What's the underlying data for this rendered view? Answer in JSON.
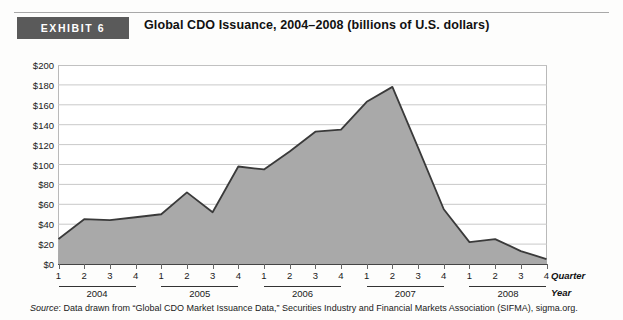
{
  "exhibit": {
    "badge_label": "EXHIBIT 6",
    "title": "Global CDO Issuance, 2004–2008 (billions of U.S. dollars)"
  },
  "source": {
    "prefix": "Source",
    "text": ": Data drawn from “Global CDO Market Issuance Data,” Securities Industry and Financial Markets Association (SIFMA), sigma.org."
  },
  "axis_captions": {
    "quarter": "Quarter",
    "year": "Year"
  },
  "colors": {
    "badge_bg": "#5a5a5a",
    "area_fill": "#a9a9a9",
    "area_line": "#3a3a3a",
    "grid": "#c9c9c9",
    "frame": "#b9b9b9"
  },
  "chart_data": {
    "type": "area",
    "title": "Global CDO Issuance, 2004–2008 (billions of U.S. dollars)",
    "xlabel": "Quarter / Year",
    "ylabel": "Billions of U.S. dollars",
    "ylim": [
      0,
      200
    ],
    "ytick_labels": [
      "$0",
      "$20",
      "$40",
      "$60",
      "$80",
      "$100",
      "$120",
      "$140",
      "$160",
      "$180",
      "$200"
    ],
    "ytick_values": [
      0,
      20,
      40,
      60,
      80,
      100,
      120,
      140,
      160,
      180,
      200
    ],
    "grid": true,
    "legend": "none",
    "quarter_labels": [
      "1",
      "2",
      "3",
      "4",
      "1",
      "2",
      "3",
      "4",
      "1",
      "2",
      "3",
      "4",
      "1",
      "2",
      "3",
      "4",
      "1",
      "2",
      "3",
      "4"
    ],
    "years": [
      "2004",
      "2005",
      "2006",
      "2007",
      "2008"
    ],
    "categories": [
      "2004 Q1",
      "2004 Q2",
      "2004 Q3",
      "2004 Q4",
      "2005 Q1",
      "2005 Q2",
      "2005 Q3",
      "2005 Q4",
      "2006 Q1",
      "2006 Q2",
      "2006 Q3",
      "2006 Q4",
      "2007 Q1",
      "2007 Q2",
      "2007 Q3",
      "2007 Q4",
      "2008 Q1",
      "2008 Q2",
      "2008 Q3",
      "2008 Q4"
    ],
    "values": [
      25,
      45,
      44,
      47,
      50,
      72,
      52,
      98,
      95,
      113,
      133,
      135,
      163,
      178,
      117,
      55,
      22,
      25,
      13,
      5
    ]
  }
}
